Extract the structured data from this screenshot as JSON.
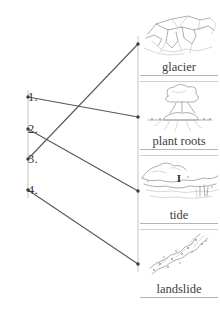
{
  "exercise": {
    "type": "matching-diagram",
    "left_items": [
      {
        "label": "1.",
        "dot_x": 28,
        "dot_y": 97,
        "text_y": 89
      },
      {
        "label": "2.",
        "dot_x": 28,
        "dot_y": 129,
        "text_y": 121
      },
      {
        "label": "3.",
        "dot_x": 28,
        "dot_y": 159,
        "text_y": 151
      },
      {
        "label": "4.",
        "dot_x": 28,
        "dot_y": 190,
        "text_y": 182
      }
    ],
    "right_panels": [
      {
        "caption": "glacier",
        "icon": "glacier-sketch-icon",
        "top": 8,
        "art_height": 52,
        "dot_x": 138,
        "dot_y": 44
      },
      {
        "caption": "plant roots",
        "icon": "plant-roots-sketch-icon",
        "top": 82,
        "art_height": 52,
        "dot_x": 138,
        "dot_y": 117
      },
      {
        "caption": "tide",
        "icon": "tide-sketch-icon",
        "top": 156,
        "art_height": 52,
        "dot_x": 138,
        "dot_y": 191
      },
      {
        "caption": "landslide",
        "icon": "landslide-sketch-icon",
        "top": 230,
        "art_height": 52,
        "dot_x": 138,
        "dot_y": 264
      }
    ],
    "connections": [
      {
        "from": "1.",
        "to": "plant roots",
        "x1": 28,
        "y1": 97,
        "x2": 138,
        "y2": 117
      },
      {
        "from": "2.",
        "to": "tide",
        "x1": 28,
        "y1": 129,
        "x2": 138,
        "y2": 191
      },
      {
        "from": "3.",
        "to": "glacier",
        "x1": 28,
        "y1": 159,
        "x2": 138,
        "y2": 44
      },
      {
        "from": "4.",
        "to": "landslide",
        "x1": 28,
        "y1": 190,
        "x2": 138,
        "y2": 264
      }
    ],
    "tide_marker": "I",
    "colors": {
      "line": "#585858",
      "dot": "#3c3c3c",
      "caption": "#404040",
      "sketch": "#8d8d8d",
      "rule": "#b5b5b5",
      "spine": "#e2e2e2",
      "background": "#ffffff"
    }
  }
}
